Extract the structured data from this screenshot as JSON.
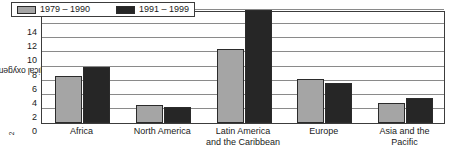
{
  "chart_data": {
    "type": "bar",
    "title": "",
    "subtitle": "",
    "xlabel": "",
    "ylabel": "Biological oxygen demand [mg/L O2]",
    "ylabel_parts": {
      "prefix": "Biological oxygen demand [mg/L O",
      "subscript": "2",
      "suffix": "]"
    },
    "categories": [
      "Africa",
      "North America",
      "Latin America\nand the Caribbean",
      "Europe",
      "Asia and the\nPacific"
    ],
    "series": [
      {
        "name": "1979 – 1990",
        "color": "#a5a5a5",
        "values": [
          6.7,
          2.6,
          10.5,
          6.3,
          2.9
        ]
      },
      {
        "name": "1991 – 1999",
        "color": "#262626",
        "values": [
          8.0,
          2.3,
          16.0,
          5.7,
          3.5
        ]
      }
    ],
    "ylim": [
      0,
      16
    ],
    "yticks": [
      0,
      2,
      4,
      6,
      8,
      10,
      12,
      14
    ],
    "ytick_labels": [
      "0",
      "2",
      "4",
      "6",
      "8",
      "10",
      "12",
      "14"
    ],
    "gridlines": [
      2,
      4,
      6,
      8,
      10,
      12,
      14,
      16
    ],
    "grid": true,
    "legend_position": "top-left-inside",
    "axis_color": "#3c3c3c",
    "grid_color": "#8a8a8a",
    "background": "#ffffff"
  }
}
